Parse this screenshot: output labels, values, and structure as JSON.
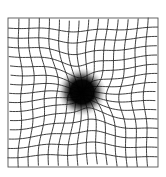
{
  "figure": {
    "canvas": {
      "width": 166,
      "height": 177,
      "background": "#ffffff"
    },
    "grid": {
      "left": 8,
      "top": 18,
      "right": 158,
      "bottom": 167,
      "columns": 15,
      "rows": 16,
      "line_color": "#2a2a2a",
      "border_color": "#555555",
      "line_width": 0.9
    },
    "distortion": {
      "center_x": 82,
      "center_y": 93,
      "strength": 16,
      "radius": 38
    },
    "scotoma": {
      "center_x": 82,
      "center_y": 92,
      "core_radius": 13,
      "fade_radius": 24,
      "color": "#000000"
    }
  }
}
